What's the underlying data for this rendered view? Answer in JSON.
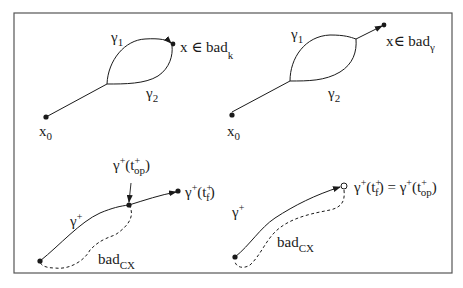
{
  "figure": {
    "frame_color": "#555555",
    "ink_color": "#1a1a1a",
    "panels": [
      {
        "id": "top-left",
        "start_label": "x",
        "start_sub": "0",
        "path1_label": "γ",
        "path1_sub": "1",
        "path2_label": "γ",
        "path2_sub": "2",
        "end_label": "x ∈ bad",
        "end_sub": "k"
      },
      {
        "id": "top-right",
        "start_label": "x",
        "start_sub": "0",
        "path1_label": "γ",
        "path1_sub": "1",
        "path2_label": "γ",
        "path2_sub": "2",
        "end_label": "x∈ bad",
        "end_sub": "γ"
      },
      {
        "id": "bottom-left",
        "path_label": "γ",
        "path_sup": "+",
        "mid_label_pre": "γ",
        "mid_label_sup": "+",
        "mid_label_open": "(t",
        "mid_label_tsup": "+",
        "mid_label_tsub": "op",
        "mid_label_close": ")",
        "end_label_pre": "γ",
        "end_label_sup": "+",
        "end_label_open": "(t",
        "end_label_tsup": "+",
        "end_label_tsub": "f",
        "end_label_close": ")",
        "region_label": "bad",
        "region_sub": "CX"
      },
      {
        "id": "bottom-right",
        "path_label": "γ",
        "path_sup": "+",
        "end_label_pre": "γ",
        "end_label_sup": "+",
        "end_label_open": "(t",
        "end_label_tsup": "+",
        "end_label_tsub": "f",
        "end_label_mid": ") = γ",
        "end_label_sup2": "+",
        "end_label_open2": "(t",
        "end_label_tsup2": "+",
        "end_label_tsub2": "op",
        "end_label_close": ")",
        "region_label": "bad",
        "region_sub": "CX"
      }
    ]
  }
}
